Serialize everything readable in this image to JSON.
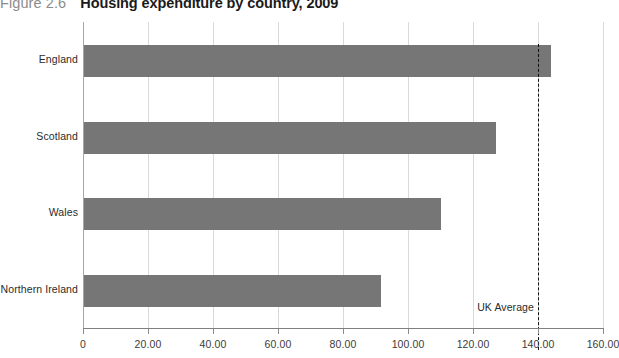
{
  "title": {
    "figure_number": "Figure 2.6",
    "caption": "Housing expenditure by country, 2009"
  },
  "chart_data": {
    "type": "bar",
    "orientation": "horizontal",
    "title": "Housing expenditure by country, 2009",
    "categories": [
      "England",
      "Scotland",
      "Wales",
      "Northern Ireland"
    ],
    "values": [
      144.0,
      127.0,
      110.0,
      91.7
    ],
    "xlabel": "",
    "ylabel": "",
    "xlim": [
      0,
      160
    ],
    "xticks": [
      0,
      20,
      40,
      60,
      80,
      100,
      120,
      140,
      160
    ],
    "xtick_labels": [
      "0",
      "20.00",
      "40.00",
      "60.00",
      "80.00",
      "100.00",
      "120.00",
      "140.00",
      "160.00"
    ],
    "grid": "vertical",
    "legend": "none",
    "bar_color": "#767676",
    "annotations": [
      {
        "label": "UK Average",
        "type": "reference-line",
        "value": 140,
        "style": "dashed",
        "color": "#111111"
      }
    ]
  }
}
